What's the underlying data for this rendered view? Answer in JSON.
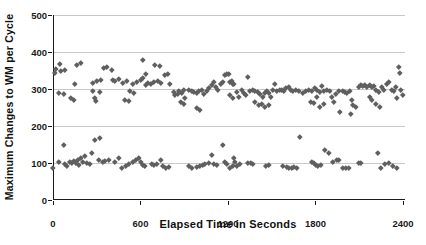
{
  "colors": {
    "background": "#ffffff",
    "axis": "#1a1a1a",
    "gridline": "#c9c9c9",
    "marker": "#5f5f5f",
    "text": "#111111"
  },
  "chart_data": {
    "type": "scatter",
    "title": "",
    "xlabel": "Elapsed Time in Seconds",
    "ylabel": "Maximum Changes to WM per Cycle",
    "xlim": [
      0,
      2400
    ],
    "ylim": [
      0,
      500
    ],
    "x_ticks": [
      0,
      600,
      1200,
      1800,
      2400
    ],
    "y_ticks": [
      0,
      100,
      200,
      300,
      400,
      500
    ],
    "grid": "horizontal-gridlines-at-y-ticks",
    "legend": "none",
    "marker_shape": "diamond",
    "series": [
      {
        "name": "upper-band",
        "points": [
          [
            9,
            344
          ],
          [
            21,
            354
          ],
          [
            43,
            291
          ],
          [
            48,
            369
          ],
          [
            55,
            349
          ],
          [
            71,
            288
          ],
          [
            80,
            351
          ],
          [
            121,
            275
          ],
          [
            144,
            270
          ],
          [
            151,
            315
          ],
          [
            162,
            365
          ],
          [
            192,
            371
          ],
          [
            272,
            317
          ],
          [
            276,
            296
          ],
          [
            288,
            276
          ],
          [
            295,
            268
          ],
          [
            300,
            322
          ],
          [
            322,
            292
          ],
          [
            327,
            326
          ],
          [
            345,
            358
          ],
          [
            372,
            360
          ],
          [
            402,
            353
          ],
          [
            410,
            326
          ],
          [
            427,
            322
          ],
          [
            448,
            328
          ],
          [
            478,
            317
          ],
          [
            494,
            272
          ],
          [
            505,
            322
          ],
          [
            521,
            268
          ],
          [
            528,
            295
          ],
          [
            550,
            313
          ],
          [
            555,
            290
          ],
          [
            578,
            319
          ],
          [
            601,
            326
          ],
          [
            615,
            331
          ],
          [
            619,
            380
          ],
          [
            635,
            340
          ],
          [
            638,
            311
          ],
          [
            653,
            317
          ],
          [
            672,
            313
          ],
          [
            688,
            320
          ],
          [
            699,
            365
          ],
          [
            722,
            323
          ],
          [
            733,
            362
          ],
          [
            740,
            317
          ],
          [
            768,
            338
          ],
          [
            784,
            342
          ],
          [
            798,
            315
          ],
          [
            825,
            293
          ],
          [
            837,
            284
          ],
          [
            853,
            288
          ],
          [
            866,
            296
          ],
          [
            875,
            266
          ],
          [
            883,
            290
          ],
          [
            894,
            261
          ],
          [
            897,
            297
          ],
          [
            905,
            275
          ],
          [
            934,
            299
          ],
          [
            951,
            296
          ],
          [
            967,
            293
          ],
          [
            985,
            290
          ],
          [
            988,
            248
          ],
          [
            1003,
            296
          ],
          [
            1008,
            245
          ],
          [
            1019,
            299
          ],
          [
            1035,
            288
          ],
          [
            1054,
            296
          ],
          [
            1071,
            302
          ],
          [
            1088,
            311
          ],
          [
            1104,
            320
          ],
          [
            1117,
            306
          ],
          [
            1133,
            299
          ],
          [
            1149,
            315
          ],
          [
            1167,
            320
          ],
          [
            1179,
            338
          ],
          [
            1195,
            342
          ],
          [
            1207,
            341
          ],
          [
            1209,
            320
          ],
          [
            1225,
            323
          ],
          [
            1236,
            315
          ],
          [
            1214,
            284
          ],
          [
            1232,
            277
          ],
          [
            1241,
            315
          ],
          [
            1259,
            293
          ],
          [
            1277,
            279
          ],
          [
            1294,
            297
          ],
          [
            1310,
            290
          ],
          [
            1323,
            284
          ],
          [
            1339,
            333
          ],
          [
            1351,
            296
          ],
          [
            1369,
            299
          ],
          [
            1385,
            296
          ],
          [
            1385,
            266
          ],
          [
            1401,
            293
          ],
          [
            1408,
            257
          ],
          [
            1419,
            288
          ],
          [
            1431,
            261
          ],
          [
            1442,
            279
          ],
          [
            1454,
            290
          ],
          [
            1454,
            252
          ],
          [
            1469,
            296
          ],
          [
            1477,
            257
          ],
          [
            1483,
            290
          ],
          [
            1493,
            279
          ],
          [
            1507,
            299
          ],
          [
            1523,
            315
          ],
          [
            1534,
            296
          ],
          [
            1552,
            297
          ],
          [
            1568,
            299
          ],
          [
            1584,
            296
          ],
          [
            1598,
            302
          ],
          [
            1614,
            306
          ],
          [
            1630,
            299
          ],
          [
            1641,
            296
          ],
          [
            1664,
            299
          ],
          [
            1687,
            296
          ],
          [
            1710,
            291
          ],
          [
            1732,
            296
          ],
          [
            1755,
            299
          ],
          [
            1766,
            266
          ],
          [
            1778,
            296
          ],
          [
            1789,
            262
          ],
          [
            1794,
            302
          ],
          [
            1807,
            279
          ],
          [
            1812,
            298
          ],
          [
            1830,
            293
          ],
          [
            1831,
            252
          ],
          [
            1842,
            308
          ],
          [
            1854,
            261
          ],
          [
            1858,
            296
          ],
          [
            1877,
            299
          ],
          [
            1895,
            296
          ],
          [
            1911,
            279
          ],
          [
            1927,
            266
          ],
          [
            1941,
            288
          ],
          [
            1957,
            296
          ],
          [
            1968,
            239
          ],
          [
            1986,
            296
          ],
          [
            2002,
            293
          ],
          [
            2018,
            290
          ],
          [
            2032,
            296
          ],
          [
            2041,
            234
          ],
          [
            2048,
            270
          ],
          [
            2059,
            257
          ],
          [
            2078,
            252
          ],
          [
            2094,
            306
          ],
          [
            2110,
            311
          ],
          [
            2124,
            308
          ],
          [
            2140,
            311
          ],
          [
            2151,
            306
          ],
          [
            2169,
            311
          ],
          [
            2169,
            279
          ],
          [
            2185,
            305
          ],
          [
            2185,
            270
          ],
          [
            2201,
            308
          ],
          [
            2215,
            299
          ],
          [
            2215,
            261
          ],
          [
            2231,
            293
          ],
          [
            2242,
            252
          ],
          [
            2254,
            305
          ],
          [
            2270,
            299
          ],
          [
            2288,
            315
          ],
          [
            2306,
            320
          ],
          [
            2322,
            299
          ],
          [
            2338,
            296
          ],
          [
            2352,
            305
          ],
          [
            2357,
            275
          ],
          [
            2368,
            360
          ],
          [
            2375,
            344
          ],
          [
            2384,
            297
          ],
          [
            2398,
            284
          ]
        ]
      },
      {
        "name": "lower-band",
        "points": [
          [
            0,
            86
          ],
          [
            43,
            104
          ],
          [
            71,
            149
          ],
          [
            82,
            99
          ],
          [
            98,
            92
          ],
          [
            112,
            104
          ],
          [
            128,
            101
          ],
          [
            144,
            106
          ],
          [
            158,
            101
          ],
          [
            173,
            108
          ],
          [
            180,
            95
          ],
          [
            190,
            115
          ],
          [
            204,
            104
          ],
          [
            219,
            119
          ],
          [
            235,
            101
          ],
          [
            249,
            97
          ],
          [
            265,
            128
          ],
          [
            288,
            162
          ],
          [
            311,
            108
          ],
          [
            322,
            169
          ],
          [
            341,
            104
          ],
          [
            357,
            106
          ],
          [
            386,
            110
          ],
          [
            425,
            104
          ],
          [
            448,
            113
          ],
          [
            471,
            88
          ],
          [
            501,
            92
          ],
          [
            523,
            99
          ],
          [
            550,
            104
          ],
          [
            566,
            110
          ],
          [
            585,
            115
          ],
          [
            601,
            104
          ],
          [
            615,
            95
          ],
          [
            631,
            92
          ],
          [
            677,
            99
          ],
          [
            693,
            95
          ],
          [
            711,
            97
          ],
          [
            738,
            110
          ],
          [
            756,
            92
          ],
          [
            775,
            88
          ],
          [
            791,
            90
          ],
          [
            928,
            92
          ],
          [
            951,
            88
          ],
          [
            989,
            90
          ],
          [
            1008,
            92
          ],
          [
            1026,
            95
          ],
          [
            1042,
            99
          ],
          [
            1065,
            101
          ],
          [
            1088,
            122
          ],
          [
            1104,
            99
          ],
          [
            1122,
            95
          ],
          [
            1163,
            148
          ],
          [
            1179,
            104
          ],
          [
            1195,
            99
          ],
          [
            1214,
            88
          ],
          [
            1232,
            92
          ],
          [
            1241,
            113
          ],
          [
            1248,
            104
          ],
          [
            1263,
            92
          ],
          [
            1282,
            99
          ],
          [
            1339,
            101
          ],
          [
            1355,
            101
          ],
          [
            1373,
            99
          ],
          [
            1461,
            92
          ],
          [
            1483,
            95
          ],
          [
            1579,
            92
          ],
          [
            1602,
            90
          ],
          [
            1620,
            88
          ],
          [
            1637,
            88
          ],
          [
            1652,
            90
          ],
          [
            1671,
            88
          ],
          [
            1694,
            171
          ],
          [
            1774,
            104
          ],
          [
            1790,
            101
          ],
          [
            1803,
            95
          ],
          [
            1819,
            92
          ],
          [
            1835,
            95
          ],
          [
            1865,
            135
          ],
          [
            1893,
            128
          ],
          [
            1922,
            104
          ],
          [
            1945,
            110
          ],
          [
            1961,
            108
          ],
          [
            1990,
            88
          ],
          [
            2007,
            88
          ],
          [
            2025,
            88
          ],
          [
            2094,
            101
          ],
          [
            2112,
            101
          ],
          [
            2226,
            128
          ],
          [
            2249,
            88
          ],
          [
            2272,
            99
          ],
          [
            2304,
            101
          ],
          [
            2333,
            92
          ],
          [
            2356,
            88
          ]
        ]
      }
    ]
  }
}
